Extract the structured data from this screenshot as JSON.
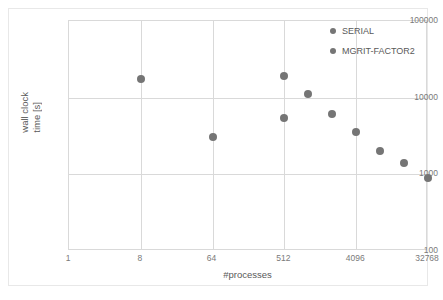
{
  "chart_data": {
    "type": "scatter",
    "title": "",
    "xlabel": "#processes",
    "ylabel": "wall clock time [s]",
    "ylabel_line1": "wall clock",
    "ylabel_line2": "time [s]",
    "xscale": "log",
    "yscale": "log",
    "xlim": [
      1,
      32768
    ],
    "ylim": [
      100,
      100000
    ],
    "grid": true,
    "legend_position": "top-right",
    "xticks": [
      "1",
      "8",
      "64",
      "512",
      "4096",
      "32768"
    ],
    "xtick_values": [
      1,
      8,
      64,
      512,
      4096,
      32768
    ],
    "yticks": [
      "100",
      "1000",
      "10000",
      "100000"
    ],
    "ytick_values": [
      100,
      1000,
      10000,
      100000
    ],
    "marker_color": "#757575",
    "gridline_color": "#d9d9d9",
    "series": [
      {
        "name": "SERIAL",
        "color": "#757575",
        "points": [
          {
            "x": 8,
            "y": 17500
          },
          {
            "x": 64,
            "y": 3100
          }
        ]
      },
      {
        "name": "MGRIT-FACTOR2",
        "color": "#757575",
        "points": [
          {
            "x": 512,
            "y": 19000
          },
          {
            "x": 512,
            "y": 5500
          },
          {
            "x": 1024,
            "y": 11000
          },
          {
            "x": 2048,
            "y": 6200
          },
          {
            "x": 4096,
            "y": 3600
          },
          {
            "x": 8192,
            "y": 2000
          },
          {
            "x": 16384,
            "y": 1400
          },
          {
            "x": 32768,
            "y": 900
          }
        ]
      }
    ]
  },
  "legend": {
    "items": [
      {
        "label": "SERIAL"
      },
      {
        "label": "MGRIT-FACTOR2"
      }
    ]
  }
}
